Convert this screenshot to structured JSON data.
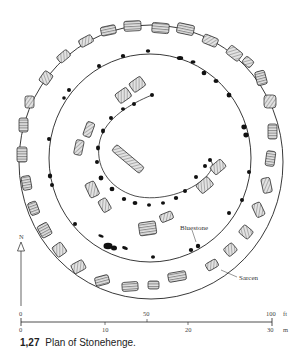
{
  "figure": {
    "title": "Plan of Stonehenge",
    "labels": {
      "bluestone": "Bluestone",
      "sarsen": "Sarcen",
      "north": "N"
    },
    "scale_bar": {
      "feet": {
        "ticks": [
          "0",
          "50",
          "100"
        ],
        "unit": "ft"
      },
      "meters": {
        "ticks": [
          "0",
          "10",
          "20",
          "30"
        ],
        "unit": "m"
      }
    },
    "colors": {
      "ink": "#111111",
      "stone_fill": "#dcdcdc",
      "background": "#ffffff"
    }
  },
  "caption": {
    "number": "1,27",
    "text": "Plan of Stonehenge."
  }
}
